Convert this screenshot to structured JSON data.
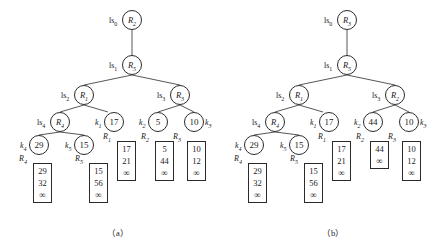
{
  "figure": {
    "panels": [
      {
        "id": "a",
        "caption": "（a）",
        "tree_nodes": [
          {
            "name": "root",
            "label": "R",
            "sub": "2",
            "x": 122,
            "y": 10,
            "side_label": "ls",
            "side_sub": "0",
            "side_pos": "left"
          },
          {
            "name": "level1",
            "label": "R",
            "sub": "5",
            "x": 122,
            "y": 55,
            "side_label": "ls",
            "side_sub": "1",
            "side_pos": "left"
          },
          {
            "name": "internal-r1",
            "label": "R",
            "sub": "1",
            "x": 74,
            "y": 85,
            "side_label": "ls",
            "side_sub": "2",
            "side_pos": "left"
          },
          {
            "name": "internal-r3",
            "label": "R",
            "sub": "3",
            "x": 170,
            "y": 85,
            "side_label": "ls",
            "side_sub": "3",
            "side_pos": "left"
          },
          {
            "name": "internal-r4",
            "label": "R",
            "sub": "4",
            "x": 50,
            "y": 112,
            "side_label": "ls",
            "side_sub": "4",
            "side_pos": "left"
          },
          {
            "name": "leaf-17",
            "label": "17",
            "sub": "",
            "x": 104,
            "y": 112,
            "side_label": "k",
            "side_sub": "1",
            "side_pos": "left"
          },
          {
            "name": "leaf-5",
            "label": "5",
            "sub": "",
            "x": 148,
            "y": 112,
            "side_label": "k",
            "side_sub": "2",
            "side_pos": "left"
          },
          {
            "name": "leaf-10",
            "label": "10",
            "sub": "",
            "x": 184,
            "y": 112,
            "side_label": "k",
            "side_sub": "3",
            "side_pos": "right"
          },
          {
            "name": "leaf-29",
            "label": "29",
            "sub": "",
            "x": 29,
            "y": 135,
            "side_label": "k",
            "side_sub": "4",
            "side_pos": "left"
          },
          {
            "name": "leaf-15",
            "label": "15",
            "sub": "",
            "x": 74,
            "y": 135,
            "side_label": "k",
            "side_sub": "5",
            "side_pos": "left"
          }
        ],
        "edges": [
          [
            132,
            30,
            132,
            55
          ],
          [
            132,
            75,
            84,
            85
          ],
          [
            132,
            75,
            180,
            85
          ],
          [
            84,
            105,
            60,
            112
          ],
          [
            84,
            105,
            108,
            112
          ],
          [
            180,
            105,
            158,
            112
          ],
          [
            180,
            105,
            194,
            112
          ],
          [
            60,
            132,
            39,
            135
          ],
          [
            60,
            132,
            84,
            135
          ]
        ],
        "lists": [
          {
            "name": "list-r1",
            "label": "R",
            "sub": "1",
            "x": 117,
            "y": 141,
            "values": [
              "17",
              "21",
              "∞"
            ]
          },
          {
            "name": "list-r2",
            "label": "R",
            "sub": "2",
            "x": 155,
            "y": 141,
            "values": [
              "5",
              "44",
              "∞"
            ]
          },
          {
            "name": "list-r3",
            "label": "R",
            "sub": "3",
            "x": 187,
            "y": 141,
            "values": [
              "10",
              "12",
              "∞"
            ]
          },
          {
            "name": "list-r4",
            "label": "R",
            "sub": "4",
            "x": 33,
            "y": 163,
            "values": [
              "29",
              "32",
              "∞"
            ]
          },
          {
            "name": "list-r5",
            "label": "R",
            "sub": "5",
            "x": 89,
            "y": 163,
            "values": [
              "15",
              "56",
              "∞"
            ]
          }
        ]
      },
      {
        "id": "b",
        "caption": "（b）",
        "tree_nodes": [
          {
            "name": "root",
            "label": "R",
            "sub": "3",
            "x": 337,
            "y": 10,
            "side_label": "ls",
            "side_sub": "0",
            "side_pos": "left"
          },
          {
            "name": "level1",
            "label": "R",
            "sub": "5",
            "x": 337,
            "y": 55,
            "side_label": "ls",
            "side_sub": "1",
            "side_pos": "left"
          },
          {
            "name": "internal-r1",
            "label": "R",
            "sub": "1",
            "x": 289,
            "y": 85,
            "side_label": "ls",
            "side_sub": "2",
            "side_pos": "left"
          },
          {
            "name": "internal-r2",
            "label": "R",
            "sub": "2",
            "x": 385,
            "y": 85,
            "side_label": "ls",
            "side_sub": "3",
            "side_pos": "left"
          },
          {
            "name": "internal-r4",
            "label": "R",
            "sub": "4",
            "x": 265,
            "y": 112,
            "side_label": "ls",
            "side_sub": "4",
            "side_pos": "left"
          },
          {
            "name": "leaf-17",
            "label": "17",
            "sub": "",
            "x": 319,
            "y": 112,
            "side_label": "k",
            "side_sub": "1",
            "side_pos": "left"
          },
          {
            "name": "leaf-44",
            "label": "44",
            "sub": "",
            "x": 363,
            "y": 112,
            "side_label": "k",
            "side_sub": "2",
            "side_pos": "left"
          },
          {
            "name": "leaf-10",
            "label": "10",
            "sub": "",
            "x": 399,
            "y": 112,
            "side_label": "k",
            "side_sub": "3",
            "side_pos": "right"
          },
          {
            "name": "leaf-29",
            "label": "29",
            "sub": "",
            "x": 244,
            "y": 135,
            "side_label": "k",
            "side_sub": "4",
            "side_pos": "left"
          },
          {
            "name": "leaf-15",
            "label": "15",
            "sub": "",
            "x": 289,
            "y": 135,
            "side_label": "k",
            "side_sub": "5",
            "side_pos": "left"
          }
        ],
        "edges": [
          [
            347,
            30,
            347,
            55
          ],
          [
            347,
            75,
            299,
            85
          ],
          [
            347,
            75,
            395,
            85
          ],
          [
            299,
            105,
            275,
            112
          ],
          [
            299,
            105,
            323,
            112
          ],
          [
            395,
            105,
            373,
            112
          ],
          [
            395,
            105,
            409,
            112
          ],
          [
            275,
            132,
            254,
            135
          ],
          [
            275,
            132,
            299,
            135
          ]
        ],
        "lists": [
          {
            "name": "list-r1",
            "label": "R",
            "sub": "1",
            "x": 332,
            "y": 141,
            "values": [
              "17",
              "21",
              "∞"
            ]
          },
          {
            "name": "list-r2",
            "label": "R",
            "sub": "2",
            "x": 370,
            "y": 141,
            "values": [
              "44",
              "∞"
            ]
          },
          {
            "name": "list-r3",
            "label": "R",
            "sub": "3",
            "x": 402,
            "y": 141,
            "values": [
              "10",
              "12",
              "∞"
            ]
          },
          {
            "name": "list-r4",
            "label": "R",
            "sub": "4",
            "x": 248,
            "y": 163,
            "values": [
              "29",
              "32",
              "∞"
            ]
          },
          {
            "name": "list-r5",
            "label": "R",
            "sub": "5",
            "x": 304,
            "y": 163,
            "values": [
              "15",
              "56",
              "∞"
            ]
          }
        ]
      }
    ],
    "caption_a": {
      "text": "（a）",
      "x": 107,
      "y": 226
    },
    "caption_b": {
      "text": "（b）",
      "x": 322,
      "y": 226
    },
    "colors": {
      "stroke": "#2b2b2b",
      "background": "#ffffff",
      "text": "#1a1a1a"
    }
  }
}
